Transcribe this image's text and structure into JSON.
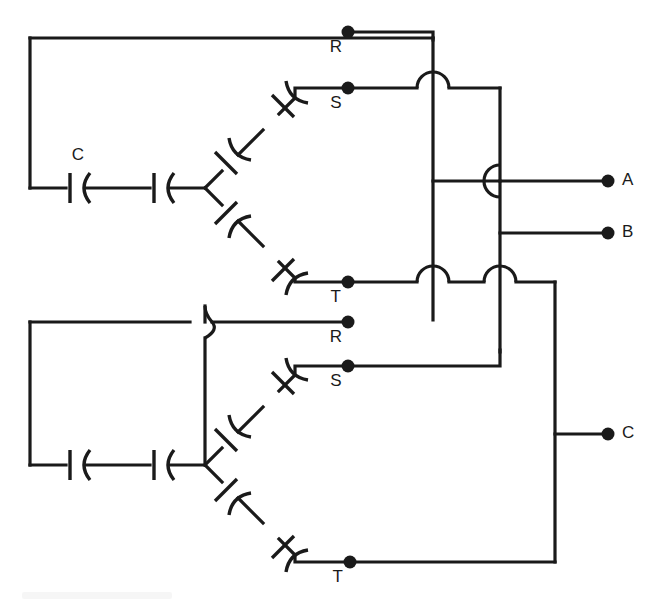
{
  "figure": {
    "kind": "electrical-schematic",
    "background_color": "#ffffff",
    "line_color": "#1a1a1a",
    "width": 660,
    "height": 607
  },
  "labels": {
    "bank1_cap_label": "C",
    "bank1_phase_r": "R",
    "bank1_phase_s": "S",
    "bank1_phase_t": "T",
    "bank2_phase_r": "R",
    "bank2_phase_s": "S",
    "bank2_phase_t": "T",
    "output_a": "A",
    "output_b": "B",
    "output_c": "C"
  },
  "banks": [
    {
      "name": "upper-capacitor-bank",
      "star_point": [
        205,
        188
      ],
      "phases": [
        {
          "phase": "R",
          "terminal": [
            348,
            32
          ],
          "series_capacitors": 2,
          "path": "left-loop"
        },
        {
          "phase": "S",
          "terminal": [
            348,
            88
          ],
          "series_capacitors": 2,
          "path": "upper-diagonal"
        },
        {
          "phase": "T",
          "terminal": [
            348,
            282
          ],
          "series_capacitors": 2,
          "path": "lower-diagonal"
        }
      ]
    },
    {
      "name": "lower-capacitor-bank",
      "star_point": [
        205,
        465
      ],
      "phases": [
        {
          "phase": "R",
          "terminal": [
            348,
            322
          ],
          "series_capacitors": 2,
          "path": "left-loop"
        },
        {
          "phase": "S",
          "terminal": [
            348,
            366
          ],
          "series_capacitors": 2,
          "path": "upper-diagonal"
        },
        {
          "phase": "T",
          "terminal": [
            350,
            562
          ],
          "series_capacitors": 2,
          "path": "lower-diagonal"
        }
      ]
    }
  ],
  "outputs": [
    {
      "name": "A",
      "terminal": [
        608,
        181
      ],
      "label_at": [
        622,
        181
      ]
    },
    {
      "name": "B",
      "terminal": [
        608,
        233
      ],
      "label_at": [
        622,
        233
      ]
    },
    {
      "name": "C",
      "terminal": [
        608,
        434
      ],
      "label_at": [
        622,
        434
      ]
    }
  ],
  "bus_lines": [
    {
      "name": "bus-r",
      "x": 433,
      "from_y": 32,
      "to_y": 320
    },
    {
      "name": "bus-s",
      "x": 500,
      "from_y": 88,
      "to_y": 352
    },
    {
      "name": "bus-t",
      "x": 555,
      "from_y": 282,
      "to_y": 562
    }
  ],
  "wire_hops": [
    {
      "at": [
        433,
        88
      ],
      "orientation": "horizontal-over-vertical"
    },
    {
      "at": [
        500,
        181
      ],
      "orientation": "vertical-over-horizontal"
    },
    {
      "at": [
        433,
        282
      ],
      "orientation": "horizontal-over-vertical"
    },
    {
      "at": [
        500,
        282
      ],
      "orientation": "horizontal-over-vertical"
    },
    {
      "at": [
        205,
        322
      ],
      "orientation": "vertical-over-horizontal"
    }
  ],
  "capacitor_count_total": 12,
  "symbol_style": "plate-and-curve"
}
